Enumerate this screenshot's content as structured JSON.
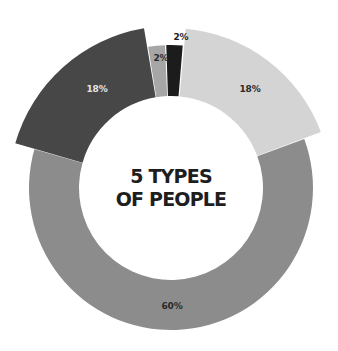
{
  "chart_data": {
    "type": "pie",
    "subtype": "donut",
    "title": "5 TYPES OF PEOPLE",
    "title_lines": [
      "5 TYPES",
      "OF PEOPLE"
    ],
    "categories": [
      "Type A",
      "Type B",
      "Type C",
      "Type D",
      "Type E"
    ],
    "values": [
      18,
      60,
      18,
      2,
      2
    ],
    "value_labels": [
      "18%",
      "60%",
      "18%",
      "2%",
      "2%"
    ],
    "colors": [
      "#d4d4d4",
      "#8c8c8c",
      "#474747",
      "#a6a6a6",
      "#1c1c1c"
    ],
    "label_colors": [
      "#2a2a2a",
      "#2a2a2a",
      "#e6e6e6",
      "#2a2a2a",
      "#1c1c1c"
    ],
    "legend": "none",
    "start_angle_deg": 5,
    "direction": "clockwise"
  },
  "geometry": {
    "cx": 171,
    "cy": 188,
    "inner_radius": 92,
    "outer_radii": [
      160,
      142,
      162,
      143,
      143
    ],
    "gap_deg": [
      0.6,
      0,
      0.4,
      0.4,
      0.6
    ],
    "label_positions": [
      {
        "x": 250,
        "y": 89
      },
      {
        "x": 172,
        "y": 306
      },
      {
        "x": 97,
        "y": 89
      },
      {
        "x": 161,
        "y": 58
      },
      {
        "x": 181,
        "y": 37
      }
    ]
  }
}
